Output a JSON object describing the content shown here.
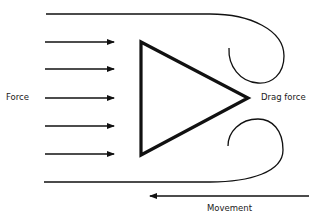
{
  "diagram": {
    "type": "drag-force-flow",
    "labels": {
      "force": "Force",
      "drag_force": "Drag force",
      "movement": "Movement"
    },
    "force_arrows_count": 5,
    "colors": {
      "stroke": "#111111",
      "background": "#ffffff",
      "text": "#1a1a1a"
    }
  }
}
